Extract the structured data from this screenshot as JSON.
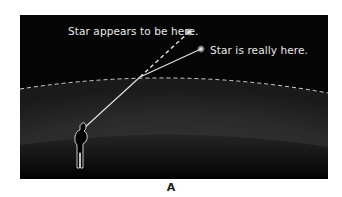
{
  "diagram": {
    "panel_label": "A",
    "labels": {
      "apparent_star": "Star appears to be here.",
      "real_star": "Star is really here."
    },
    "elements": {
      "atmosphere_boundary": "dashed curved line",
      "observer": "person silhouette outline",
      "light_path_real": "solid line from observer bending at atmosphere to real star",
      "light_path_apparent": "dashed line extending straight to apparent star"
    },
    "colors": {
      "sky": "#050505",
      "atmosphere": "#2a2a2a",
      "ground": "#0a0a0a",
      "lines": "#e8e8e8"
    }
  }
}
